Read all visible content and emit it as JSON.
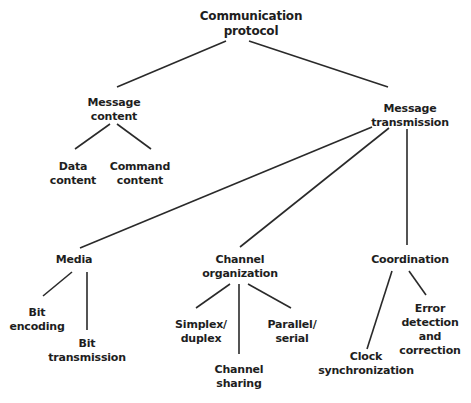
{
  "diagram": {
    "nodes": {
      "root": {
        "lines": [
          "Communication",
          "protocol"
        ]
      },
      "message_content": {
        "lines": [
          "Message",
          "content"
        ]
      },
      "data_content": {
        "lines": [
          "Data",
          "content"
        ]
      },
      "command_content": {
        "lines": [
          "Command",
          "content"
        ]
      },
      "message_transmission": {
        "lines": [
          "Message",
          "transmission"
        ]
      },
      "media": {
        "lines": [
          "Media"
        ]
      },
      "bit_encoding": {
        "lines": [
          "Bit",
          "encoding"
        ]
      },
      "bit_transmission": {
        "lines": [
          "Bit",
          "transmission"
        ]
      },
      "channel_organization": {
        "lines": [
          "Channel",
          "organization"
        ]
      },
      "simplex_duplex": {
        "lines": [
          "Simplex/",
          "duplex"
        ]
      },
      "channel_sharing": {
        "lines": [
          "Channel",
          "sharing"
        ]
      },
      "parallel_serial": {
        "lines": [
          "Parallel/",
          "serial"
        ]
      },
      "coordination": {
        "lines": [
          "Coordination"
        ]
      },
      "clock_synchronization": {
        "lines": [
          "Clock",
          "synchronization"
        ]
      },
      "error_detection": {
        "lines": [
          "Error",
          "detection",
          "and",
          "correction"
        ]
      }
    },
    "edges": [
      [
        "root",
        "message_content"
      ],
      [
        "root",
        "message_transmission"
      ],
      [
        "message_content",
        "data_content"
      ],
      [
        "message_content",
        "command_content"
      ],
      [
        "message_transmission",
        "media"
      ],
      [
        "message_transmission",
        "channel_organization"
      ],
      [
        "message_transmission",
        "coordination"
      ],
      [
        "media",
        "bit_encoding"
      ],
      [
        "media",
        "bit_transmission"
      ],
      [
        "channel_organization",
        "simplex_duplex"
      ],
      [
        "channel_organization",
        "channel_sharing"
      ],
      [
        "channel_organization",
        "parallel_serial"
      ],
      [
        "coordination",
        "clock_synchronization"
      ],
      [
        "coordination",
        "error_detection"
      ]
    ],
    "colors": {
      "line": "#2a2a2a",
      "text": "#1e1e1e",
      "background": "#ffffff"
    }
  }
}
